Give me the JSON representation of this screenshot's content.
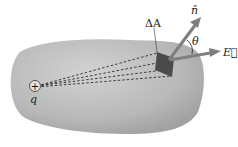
{
  "diagram": {
    "labels": {
      "area": "ΔA",
      "normal": "n̂",
      "angle": "θ",
      "field": "E⃗",
      "charge_symbol": "+",
      "charge": "q"
    },
    "colors": {
      "surface": "#b5b5b5",
      "surface_highlight": "#cfcfcf",
      "patch": "#4a4a4a",
      "arrow": "#7f7f7f",
      "dash": "#2a2a2a"
    }
  }
}
